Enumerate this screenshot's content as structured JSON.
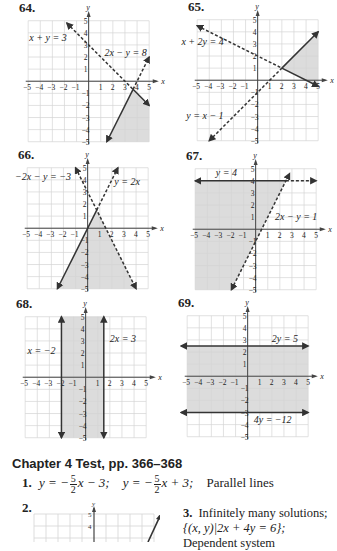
{
  "graphs": [
    {
      "number": "64.",
      "origin_px": [
        89,
        81
      ],
      "unit_px": 12.1,
      "shade": [
        [
          3.67,
          -0.67
        ],
        [
          5,
          -2
        ],
        [
          5,
          -5
        ],
        [
          1.5,
          -5
        ]
      ],
      "lines": [
        {
          "label": "x + y = 3",
          "style": "dashed",
          "from": [
            -1.8,
            4.8
          ],
          "to": [
            3.67,
            -0.67
          ],
          "arrow_start": true,
          "arrow_end": false
        },
        {
          "label": "x + y = 3 (solid part)",
          "style": "solid",
          "from": [
            3.67,
            -0.67
          ],
          "to": [
            5,
            -2
          ],
          "arrow_start": false,
          "arrow_end": true
        },
        {
          "label": "2x − y = 8",
          "style": "dashed",
          "from": [
            3.67,
            -0.67
          ],
          "to": [
            5,
            2
          ],
          "arrow_start": false,
          "arrow_end": true
        },
        {
          "label": "2x − y = 8 (solid part)",
          "style": "solid",
          "from": [
            3.67,
            -0.67
          ],
          "to": [
            1.5,
            -5
          ],
          "arrow_start": false,
          "arrow_end": true
        }
      ],
      "labels": [
        {
          "text": "x + y = 3",
          "at": [
            -4.9,
            3.3
          ]
        },
        {
          "text": "2x − y = 8",
          "at": [
            1.3,
            2.1
          ]
        }
      ]
    },
    {
      "number": "65.",
      "origin_px": [
        258,
        80
      ],
      "unit_px": 12.1,
      "shade": [
        [
          2,
          1
        ],
        [
          5,
          4
        ],
        [
          5,
          -0.5
        ]
      ],
      "lines": [
        {
          "label": "x + 2y = 4",
          "style": "dashed",
          "from": [
            -5,
            4.5
          ],
          "to": [
            2,
            1
          ],
          "arrow_start": true,
          "arrow_end": false
        },
        {
          "label": "x + 2y = 4 (solid part)",
          "style": "solid",
          "from": [
            2,
            1
          ],
          "to": [
            5,
            -0.5
          ],
          "arrow_start": false,
          "arrow_end": true
        },
        {
          "label": "y = x − 1",
          "style": "dashed",
          "from": [
            -4,
            -5
          ],
          "to": [
            2,
            1
          ],
          "arrow_start": true,
          "arrow_end": false
        },
        {
          "label": "y = x − 1 (solid part)",
          "style": "solid",
          "from": [
            2,
            1
          ],
          "to": [
            5,
            4
          ],
          "arrow_start": false,
          "arrow_end": true
        }
      ],
      "labels": [
        {
          "text": "x + 2y = 4",
          "at": [
            -6.3,
            2.9
          ]
        },
        {
          "text": "y = x − 1",
          "at": [
            -5.9,
            -3.2
          ]
        }
      ]
    },
    {
      "number": "66.",
      "origin_px": [
        88,
        228
      ],
      "unit_px": 12.1,
      "shade": [
        [
          0,
          0
        ],
        [
          0.75,
          1.5
        ],
        [
          4,
          -5
        ],
        [
          -2.5,
          -5
        ]
      ],
      "lines": [
        {
          "label": "y = 2x",
          "style": "solid",
          "from": [
            -2.5,
            -5
          ],
          "to": [
            0.75,
            1.5
          ],
          "arrow_start": true,
          "arrow_end": false
        },
        {
          "label": "y = 2x (dashed part)",
          "style": "dashed",
          "from": [
            0.75,
            1.5
          ],
          "to": [
            2.5,
            5
          ],
          "arrow_start": false,
          "arrow_end": true
        },
        {
          "label": "-2x − y = −3",
          "style": "dashed",
          "from": [
            -1,
            5
          ],
          "to": [
            4,
            -5
          ],
          "arrow_start": true,
          "arrow_end": true
        }
      ],
      "labels": [
        {
          "text": "−2x − y = −3",
          "at": [
            -6.0,
            4.0
          ]
        },
        {
          "text": "y = 2x",
          "at": [
            2.2,
            3.6
          ]
        }
      ]
    },
    {
      "number": "67.",
      "origin_px": [
        256,
        229
      ],
      "unit_px": 12.1,
      "shade": [
        [
          -5,
          4
        ],
        [
          2.5,
          4
        ],
        [
          -2,
          -5
        ],
        [
          -5,
          -5
        ]
      ],
      "lines": [
        {
          "label": "y = 4",
          "style": "solid",
          "from": [
            -5,
            4
          ],
          "to": [
            2.5,
            4
          ],
          "arrow_start": true,
          "arrow_end": false
        },
        {
          "label": "y = 4 (dashed part)",
          "style": "dashed",
          "from": [
            2.5,
            4
          ],
          "to": [
            5,
            4
          ],
          "arrow_start": false,
          "arrow_end": true
        },
        {
          "label": "2x − y = 1",
          "style": "dashed",
          "from": [
            -2,
            -5
          ],
          "to": [
            2.8,
            4.6
          ],
          "arrow_start": true,
          "arrow_end": true
        }
      ],
      "labels": [
        {
          "text": "y = 4",
          "at": [
            -3.3,
            4.4
          ]
        },
        {
          "text": "2x − y = 1",
          "at": [
            1.6,
            0.8
          ]
        }
      ]
    },
    {
      "number": "68.",
      "origin_px": [
        86,
        377
      ],
      "unit_px": 12.1,
      "shade": [
        [
          -2,
          5
        ],
        [
          1.5,
          5
        ],
        [
          1.5,
          -5
        ],
        [
          -2,
          -5
        ]
      ],
      "lines": [
        {
          "label": "x = −2",
          "style": "solid",
          "from": [
            -2,
            -5
          ],
          "to": [
            -2,
            5
          ],
          "arrow_start": true,
          "arrow_end": true
        },
        {
          "label": "2x = 3",
          "style": "solid",
          "from": [
            1.5,
            -5
          ],
          "to": [
            1.5,
            5
          ],
          "arrow_start": true,
          "arrow_end": true
        }
      ],
      "labels": [
        {
          "text": "x = −2",
          "at": [
            -4.8,
            1.9
          ]
        },
        {
          "text": "2x = 3",
          "at": [
            2.0,
            2.9
          ]
        }
      ]
    },
    {
      "number": "69.",
      "origin_px": [
        248,
        376
      ],
      "unit_px": 12.1,
      "shade": [
        [
          -5,
          2.5
        ],
        [
          5,
          2.5
        ],
        [
          5,
          -3
        ],
        [
          -5,
          -3
        ]
      ],
      "lines": [
        {
          "label": "2y = 5",
          "style": "solid",
          "from": [
            -5.5,
            2.5
          ],
          "to": [
            5,
            2.5
          ],
          "arrow_start": true,
          "arrow_end": true
        },
        {
          "label": "4y = −12",
          "style": "solid",
          "from": [
            -5.5,
            -3
          ],
          "to": [
            5,
            -3
          ],
          "arrow_start": true,
          "arrow_end": true
        }
      ],
      "labels": [
        {
          "text": "2y = 5",
          "at": [
            2.0,
            2.8
          ]
        },
        {
          "text": "4y = −12",
          "at": [
            0.5,
            -3.9
          ]
        }
      ]
    }
  ],
  "axis": {
    "x_label": "x",
    "y_label": "y",
    "min": -5,
    "max": 5
  },
  "colors": {
    "grid": "#d4d4d4",
    "axis": "#444444",
    "line": "#333333",
    "shade": "#dcdcdc",
    "text": "#222222"
  },
  "chapter_test": {
    "heading": "Chapter 4 Test, pp. 366–368",
    "answer1": {
      "number": "1.",
      "eq1_prefix": "y = −",
      "frac_num": "5",
      "frac_den": "2",
      "eq1_suffix": "x − 3;",
      "eq2_prefix": "y = −",
      "eq2_suffix": "x + 3;",
      "conclusion": "Parallel lines"
    },
    "answer2": {
      "number": "2."
    },
    "answer3": {
      "number": "3.",
      "line1": "Infinitely many solutions;",
      "line2": "{(x, y)|2x + 4y = 6};",
      "line3": "Dependent system"
    }
  }
}
